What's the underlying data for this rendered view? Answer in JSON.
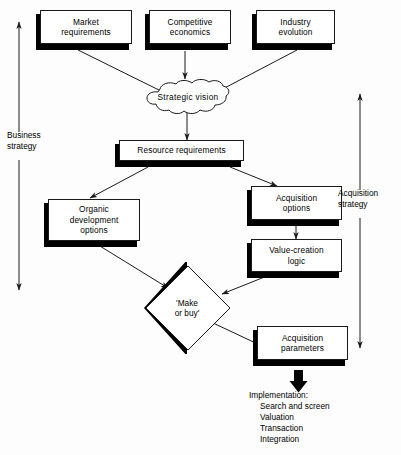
{
  "diagram": {
    "colors": {
      "line": "#1a1a1a",
      "shadow": "#000000",
      "box_fill": "#ffffff",
      "text": "#000000"
    },
    "nodes": {
      "market_requirements": "Market\nrequirements",
      "competitive_economics": "Competitive\neconomics",
      "industry_evolution": "Industry\nevolution",
      "strategic_vision": "Strategic vision",
      "resource_requirements": "Resource requirements",
      "organic_development_options": "Organic\ndevelopment\noptions",
      "acquisition_options": "Acquisition\noptions",
      "value_creation_logic": "Value-creation\nlogic",
      "make_or_buy_line1": "'Make",
      "make_or_buy_line2": "or buy'",
      "acquisition_parameters": "Acquisition\nparameters"
    },
    "range_labels": {
      "business_strategy": "Business\nstrategy",
      "acquisition_strategy": "Acquisition\nstrategy"
    },
    "implementation": {
      "title": "Implementation:",
      "items": [
        "Search and screen",
        "Valuation",
        "Transaction",
        "Integration"
      ]
    }
  }
}
